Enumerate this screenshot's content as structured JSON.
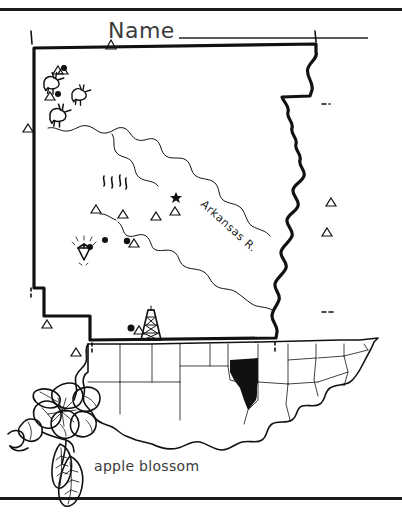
{
  "worksheet": {
    "name_label": "Name",
    "flower_caption": "apple blossom",
    "river_label": "Arkansas R.",
    "state": "Arkansas",
    "colors": {
      "ink": "#111111",
      "text": "#3b3b3b",
      "rule": "#1a1a1a",
      "highlight_fill": "#111111",
      "background": "#ffffff"
    }
  },
  "map": {
    "title_state": "Arkansas",
    "capital_marker": "star-icon",
    "symbols": [
      {
        "name": "bird-icon",
        "label": "mockingbird",
        "count": 3
      },
      {
        "name": "triangle-icon",
        "label": "mountain",
        "count": 12
      },
      {
        "name": "dot-icon",
        "label": "city",
        "count": 4
      },
      {
        "name": "diamond-icon",
        "label": "diamond mine",
        "count": 1
      },
      {
        "name": "hot-springs-icon",
        "label": "hot springs",
        "count": 1
      },
      {
        "name": "oil-derrick-icon",
        "label": "oil derrick",
        "count": 1
      },
      {
        "name": "star-icon",
        "label": "state capital",
        "count": 1
      }
    ]
  },
  "inset": {
    "name": "united-states-inset",
    "highlighted_state": "Arkansas"
  },
  "flower": {
    "name": "apple-blossom-illustration",
    "caption": "apple blossom"
  }
}
